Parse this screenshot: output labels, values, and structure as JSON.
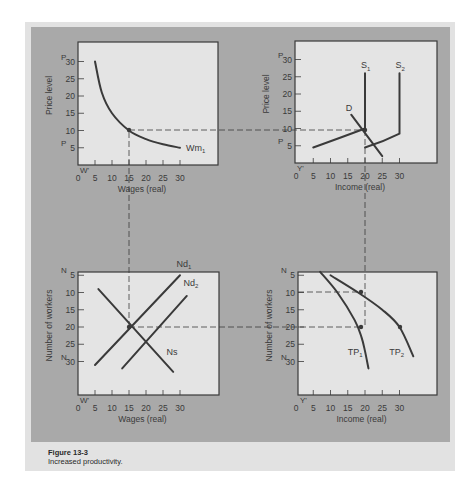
{
  "figure": {
    "number": "Figure 13-3",
    "caption": "Increased productivity."
  },
  "colors": {
    "background": "#ffffff",
    "figure_box": "#e2e2e2",
    "panel": "#a9a9a9",
    "plot_area": "#e4e4e4",
    "ink": "#3a3a3a"
  },
  "chart_data": [
    {
      "type": "line",
      "position": "top-left",
      "title": "",
      "xlabel": "Wages (real)",
      "ylabel": "Price level",
      "x_ticks": [
        0,
        5,
        10,
        15,
        20,
        25,
        30
      ],
      "y_ticks": [
        5,
        10,
        15,
        20,
        25,
        30
      ],
      "x_marker": "W'",
      "y_markers": [
        "P",
        "P"
      ],
      "xlim": [
        0,
        33
      ],
      "ylim": [
        0,
        33
      ],
      "series": [
        {
          "name": "Wm1",
          "label": "Wm",
          "subscript": "1",
          "x": [
            5,
            7,
            10,
            15,
            20,
            25,
            30
          ],
          "y": [
            30,
            21,
            15,
            10,
            7.5,
            6,
            5
          ]
        }
      ],
      "guides": {
        "vertical_x": 15,
        "horizontal_y": 10
      }
    },
    {
      "type": "line",
      "position": "top-right",
      "title": "",
      "xlabel": "Income (real)",
      "ylabel": "Price level",
      "x_ticks": [
        0,
        5,
        10,
        15,
        20,
        25,
        30
      ],
      "y_ticks": [
        5,
        10,
        15,
        20,
        25,
        30
      ],
      "x_marker": "Y'",
      "y_markers": [
        "P",
        "P"
      ],
      "xlim": [
        0,
        33
      ],
      "ylim": [
        0,
        33
      ],
      "series": [
        {
          "name": "S1",
          "label": "S",
          "subscript": "1",
          "x": [
            5,
            12,
            20,
            20
          ],
          "y": [
            4.5,
            7,
            10,
            26
          ]
        },
        {
          "name": "S2",
          "label": "S",
          "subscript": "2",
          "x": [
            20,
            25,
            30,
            30
          ],
          "y": [
            4.5,
            6,
            8.5,
            26
          ]
        },
        {
          "name": "D",
          "label": "D",
          "subscript": "",
          "x": [
            16,
            25
          ],
          "y": [
            14,
            2
          ]
        }
      ],
      "guides": {
        "vertical_x": 20,
        "horizontal_y": 10
      }
    },
    {
      "type": "line",
      "position": "bottom-left",
      "title": "",
      "xlabel": "Wages (real)",
      "ylabel": "Number of workers",
      "x_ticks": [
        0,
        5,
        10,
        15,
        20,
        25,
        30
      ],
      "y_ticks": [
        5,
        10,
        15,
        20,
        25,
        30
      ],
      "x_marker": "W'",
      "y_markers": [
        "N",
        "N"
      ],
      "y_inverted": true,
      "xlim": [
        0,
        33
      ],
      "ylim": [
        0,
        33
      ],
      "series": [
        {
          "name": "Nd1",
          "label": "Nd",
          "subscript": "1",
          "x": [
            5,
            30
          ],
          "y": [
            31,
            5
          ]
        },
        {
          "name": "Nd2",
          "label": "Nd",
          "subscript": "2",
          "x": [
            13,
            32
          ],
          "y": [
            32,
            11
          ]
        },
        {
          "name": "Ns",
          "label": "Ns",
          "subscript": "",
          "x": [
            6,
            28
          ],
          "y": [
            9,
            33
          ]
        }
      ],
      "guides": {
        "vertical_x": 15,
        "horizontal_y": 20
      }
    },
    {
      "type": "line",
      "position": "bottom-right",
      "title": "",
      "xlabel": "Income (real)",
      "ylabel": "Number of workers",
      "x_ticks": [
        0,
        5,
        10,
        15,
        20,
        25,
        30
      ],
      "y_ticks": [
        5,
        10,
        15,
        20,
        25,
        30
      ],
      "x_marker": "Y'",
      "y_markers": [
        "N",
        "N"
      ],
      "y_inverted": true,
      "xlim": [
        0,
        33
      ],
      "ylim": [
        0,
        33
      ],
      "series": [
        {
          "name": "TP1",
          "label": "TP",
          "subscript": "1",
          "x": [
            7,
            12,
            17,
            19,
            20,
            21
          ],
          "y": [
            4,
            10,
            18,
            23,
            27,
            32
          ]
        },
        {
          "name": "TP2",
          "label": "TP",
          "subscript": "2",
          "x": [
            10,
            18,
            25,
            30,
            34
          ],
          "y": [
            5,
            10,
            15,
            20,
            28.5
          ]
        }
      ],
      "guides": {
        "vertical_x": 18,
        "horizontal_y_levels": [
          10,
          20
        ]
      }
    }
  ]
}
